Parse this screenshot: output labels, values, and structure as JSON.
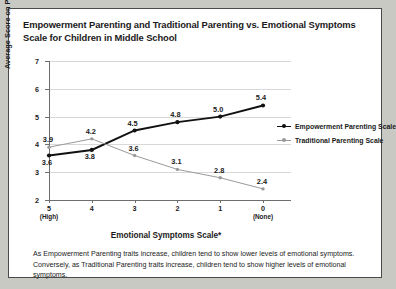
{
  "figure": {
    "title": "Empowerment Parenting and Traditional Parenting vs. Emotional Symptoms Scale for Children in Middle School",
    "footnote": "As Empowerment Parenting traits increase, children tend to show lower levels of emotional symptoms. Conversely, as Traditional Parenting traits increase, children tend to show higher levels of emotional symptoms."
  },
  "colors": {
    "empowerment": "#111111",
    "traditional": "#9a9a9a",
    "grid": "#d8d8d8",
    "axis": "#6e6e6e",
    "panel_background": "#ffffff",
    "page_background": "#c9c9c4"
  },
  "chart_data": {
    "type": "line",
    "title": "Empowerment Parenting and Traditional Parenting vs. Emotional Symptoms Scale for Children in Middle School",
    "xlabel": "Emotional Symptoms Scale*",
    "ylabel": "Average Score on Parenting Scales",
    "categories": [
      "5",
      "4",
      "3",
      "2",
      "1",
      "0"
    ],
    "category_sublabels": [
      "(High)",
      "",
      "",
      "",
      "",
      "(None)"
    ],
    "xtick_labels": [
      "5",
      "4",
      "3",
      "2",
      "1",
      "0"
    ],
    "ytick_labels": [
      "7",
      "6",
      "5",
      "4",
      "3",
      "2"
    ],
    "ylim": [
      2,
      7
    ],
    "ytick_step": 1,
    "grid": true,
    "legend_position": "right",
    "series": [
      {
        "name": "Empowerment Parenting Scale",
        "color": "#111111",
        "values": [
          3.6,
          3.8,
          4.5,
          4.8,
          5.0,
          5.4
        ],
        "labels": [
          "3.6",
          "3.8",
          "4.5",
          "4.8",
          "5.0",
          "5.4"
        ],
        "label_side": [
          "below",
          "below",
          "above",
          "above",
          "above",
          "above"
        ]
      },
      {
        "name": "Traditional Parenting Scale",
        "color": "#9a9a9a",
        "values": [
          3.9,
          4.2,
          3.6,
          3.1,
          2.8,
          2.4
        ],
        "labels": [
          "3.9",
          "4.2",
          "3.6",
          "3.1",
          "2.8",
          "2.4"
        ],
        "label_side": [
          "above",
          "above",
          "above",
          "above",
          "above",
          "above"
        ]
      }
    ]
  },
  "legend": {
    "items": [
      {
        "label": "Empowerment Parenting Scale"
      },
      {
        "label": "Traditional Parenting Scale"
      }
    ]
  }
}
